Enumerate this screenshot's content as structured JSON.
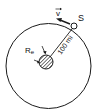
{
  "diagram": {
    "labels": {
      "satellite": "S",
      "velocity": "v",
      "distance": "100 mi",
      "earth_radius": "R",
      "earth_radius_sub": "e"
    },
    "colors": {
      "stroke": "#1a1a1a",
      "background": "#ffffff"
    }
  }
}
